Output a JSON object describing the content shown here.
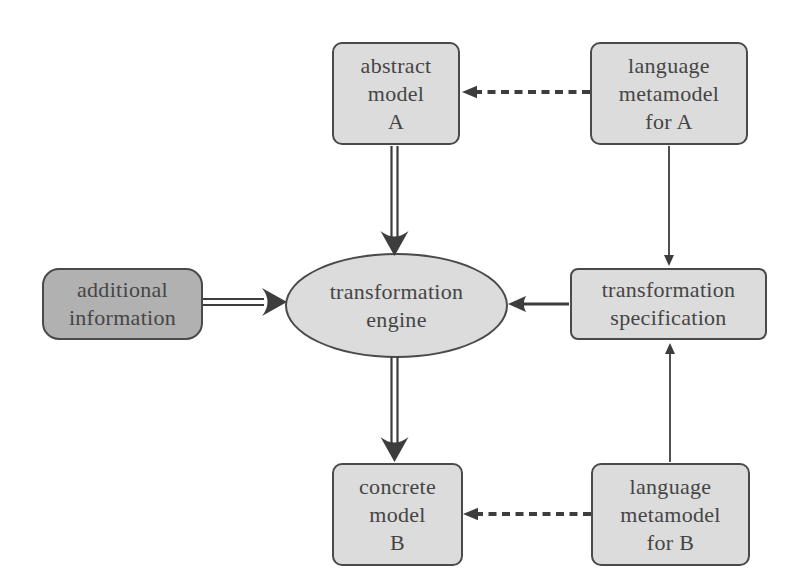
{
  "nodes": {
    "abstract_model_a": {
      "lines": [
        "abstract",
        "model",
        "A"
      ]
    },
    "language_metamodel_a": {
      "lines": [
        "language",
        "metamodel",
        "for A"
      ]
    },
    "additional_information": {
      "lines": [
        "additional",
        "information"
      ]
    },
    "transformation_engine": {
      "lines": [
        "transformation",
        "engine"
      ]
    },
    "transformation_specification": {
      "lines": [
        "transformation",
        "specification"
      ]
    },
    "concrete_model_b": {
      "lines": [
        "concrete",
        "model",
        "B"
      ]
    },
    "language_metamodel_b": {
      "lines": [
        "language",
        "metamodel",
        "for B"
      ]
    }
  },
  "edges": [
    {
      "from": "language_metamodel_a",
      "to": "abstract_model_a",
      "style": "dashed-arrow"
    },
    {
      "from": "language_metamodel_a",
      "to": "transformation_specification",
      "style": "thin-arrow"
    },
    {
      "from": "abstract_model_a",
      "to": "transformation_engine",
      "style": "double-line-arrow"
    },
    {
      "from": "additional_information",
      "to": "transformation_engine",
      "style": "double-line-arrow"
    },
    {
      "from": "transformation_specification",
      "to": "transformation_engine",
      "style": "solid-arrow"
    },
    {
      "from": "transformation_engine",
      "to": "concrete_model_b",
      "style": "double-line-arrow"
    },
    {
      "from": "language_metamodel_b",
      "to": "transformation_specification",
      "style": "thin-arrow"
    },
    {
      "from": "language_metamodel_b",
      "to": "concrete_model_b",
      "style": "dashed-arrow"
    }
  ],
  "colors": {
    "node_fill": "#dcdcdc",
    "emphasis_fill": "#b1b1b1",
    "node_border": "#4a4a4a",
    "arrow": "#3d3d3d",
    "text": "#454545",
    "background": "#ffffff"
  }
}
